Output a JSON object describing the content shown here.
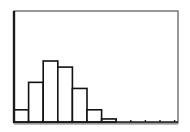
{
  "colors": {
    "background": "#ffffff",
    "frame": "#555555",
    "axis": "#1a1a1a",
    "bar_fill": "#ffffff",
    "bar_stroke": "#111111",
    "shadow": "#bbbbbb"
  },
  "plot": {
    "frame": {
      "left": 14,
      "top": 11,
      "right": 178,
      "bottom": 123
    },
    "baseline_y": 122,
    "px_per_unit": 3.05,
    "bin_start_x": 14,
    "bin_width_px": 14.6
  },
  "chart_data": {
    "type": "bar",
    "subtype": "histogram",
    "title": "",
    "xlabel": "",
    "ylabel": "",
    "categories": [
      "bin1",
      "bin2",
      "bin3",
      "bin4",
      "bin5",
      "bin6",
      "bin7",
      "bin8",
      "bin9",
      "bin10",
      "bin11"
    ],
    "values": [
      4,
      13,
      20,
      18,
      11,
      4,
      1,
      0,
      0,
      0,
      0
    ],
    "ylim": [
      0,
      36
    ],
    "grid": false,
    "legend": null,
    "x_tick_count": 11
  }
}
